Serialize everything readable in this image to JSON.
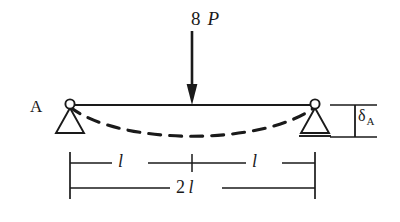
{
  "figure": {
    "background_color": "#ffffff",
    "line_color": "#1a1a1a",
    "stroke_width": 1.6
  },
  "load": {
    "magnitude": "8",
    "symbol": "P",
    "arrow_direction": "down",
    "applied_at": "midspan"
  },
  "supports": {
    "left": {
      "label": "A",
      "type": "pin",
      "icon": "pin-support-triangle-icon"
    },
    "right": {
      "label": "",
      "type": "roller",
      "icon": "roller-support-triangle-icon"
    }
  },
  "deflection": {
    "symbol": "δ",
    "subscript": "A",
    "curve_style": "dashed",
    "curve_name": "deflected-shape"
  },
  "dimensions": {
    "left_span": {
      "num": "",
      "sym": "l"
    },
    "right_span": {
      "num": "",
      "sym": "l"
    },
    "total_span": {
      "num": "2",
      "sym": "l"
    }
  },
  "geometry": {
    "beam_left_x": 70,
    "beam_right_x": 315,
    "beam_y": 105,
    "midspan_x": 192,
    "sag_depth": 33,
    "dim_row1_y": 163,
    "dim_row2_y": 188
  }
}
